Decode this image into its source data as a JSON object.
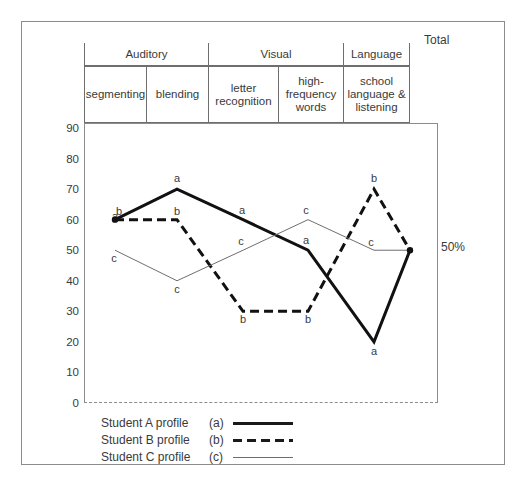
{
  "table": {
    "groups": [
      {
        "label": "Auditory",
        "span": 2
      },
      {
        "label": "Visual",
        "span": 2
      },
      {
        "label": "Language",
        "span": 1
      }
    ],
    "columns": [
      "segmenting",
      "blending",
      "letter recognition",
      "high-frequency words",
      "school language & listening"
    ],
    "total_header": "Total",
    "total_value": "50%"
  },
  "legend": {
    "entries": [
      {
        "name": "Student A profile",
        "code": "(a)",
        "style": "solid-thick"
      },
      {
        "name": "Student B profile",
        "code": "(b)",
        "style": "dashed-thick"
      },
      {
        "name": "Student C profile",
        "code": "(c)",
        "style": "solid-thin"
      }
    ]
  },
  "chart_data": {
    "type": "line",
    "title": "",
    "xlabel": "",
    "ylabel": "",
    "ylim": [
      0,
      90
    ],
    "ytick_labels": [
      "0",
      "10",
      "20",
      "30",
      "40",
      "50",
      "60",
      "70",
      "80",
      "90"
    ],
    "ytick_values": [
      0,
      10,
      20,
      30,
      40,
      50,
      60,
      70,
      80,
      90
    ],
    "grid": false,
    "legend_position": "below",
    "categories": [
      "segmenting",
      "blending",
      "letter recognition",
      "high-frequency words",
      "school language & listening",
      "Total"
    ],
    "series": [
      {
        "name": "Student A profile",
        "code": "a",
        "values": [
          60,
          70,
          60,
          50,
          20,
          50
        ]
      },
      {
        "name": "Student B profile",
        "code": "b",
        "values": [
          60,
          60,
          30,
          30,
          70,
          50
        ]
      },
      {
        "name": "Student C profile",
        "code": "c",
        "values": [
          50,
          40,
          50,
          60,
          50,
          50
        ]
      }
    ]
  }
}
